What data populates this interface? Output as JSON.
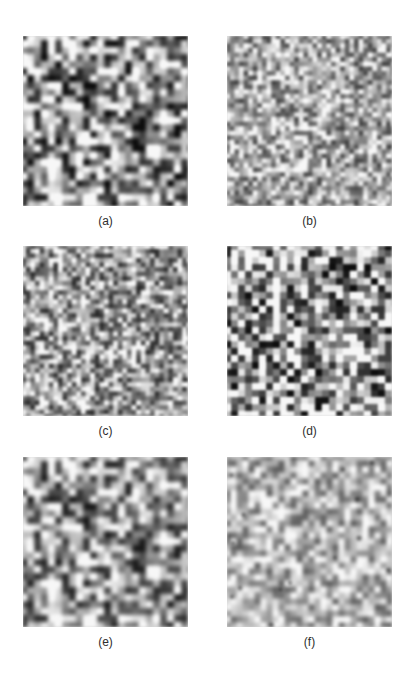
{
  "figure": {
    "panels": [
      {
        "id": "a",
        "label": "(a)",
        "x": 23,
        "y": 36,
        "texture": {
          "cell": 7.0,
          "contrast": 1.15,
          "brightness": 0.58,
          "seed": 11,
          "blur": 1.3,
          "blocky": 0.0,
          "dark_dots": 0.0
        }
      },
      {
        "id": "b",
        "label": "(b)",
        "x": 227,
        "y": 36,
        "texture": {
          "cell": 4.6,
          "contrast": 0.85,
          "brightness": 0.66,
          "seed": 23,
          "blur": 1.0,
          "blocky": 0.0,
          "dark_dots": 0.0
        }
      },
      {
        "id": "c",
        "label": "(c)",
        "x": 23,
        "y": 246,
        "texture": {
          "cell": 4.6,
          "contrast": 0.95,
          "brightness": 0.62,
          "seed": 37,
          "blur": 1.0,
          "blocky": 0.0,
          "dark_dots": 0.0
        }
      },
      {
        "id": "d",
        "label": "(d)",
        "x": 227,
        "y": 246,
        "texture": {
          "cell": 7.0,
          "contrast": 1.2,
          "brightness": 0.62,
          "seed": 41,
          "blur": 0.8,
          "blocky": 0.6,
          "dark_dots": 0.0
        }
      },
      {
        "id": "e",
        "label": "(e)",
        "x": 23,
        "y": 457,
        "texture": {
          "cell": 7.0,
          "contrast": 1.05,
          "brightness": 0.6,
          "seed": 11,
          "blur": 1.5,
          "blocky": 0.0,
          "dark_dots": 0.0
        }
      },
      {
        "id": "f",
        "label": "(f)",
        "x": 227,
        "y": 457,
        "texture": {
          "cell": 6.0,
          "contrast": 0.7,
          "brightness": 0.7,
          "seed": 59,
          "blur": 1.8,
          "blocky": 0.0,
          "dark_dots": 0.02
        }
      }
    ]
  },
  "colors": {
    "background": "#ffffff",
    "caption": "#2e2e2e"
  }
}
